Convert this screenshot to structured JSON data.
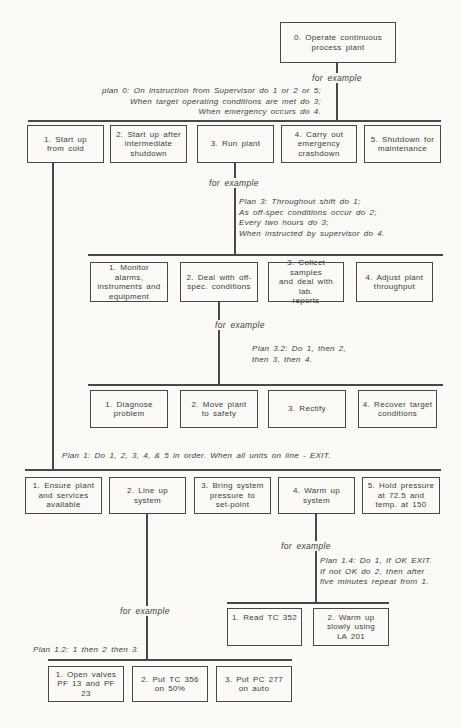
{
  "meta": {
    "background_color": "#fbfaf7",
    "ink_color": "#3c3c3c",
    "line_color": "#484848"
  },
  "labels": {
    "for_example": "for example"
  },
  "plans": {
    "plan0": "plan 0: On instruction from Supervisor  do 1 or 2 or 5;\nWhen target operating conditions are met do 3;\nWhen emergency occurs do 4.",
    "plan3": "Plan 3: Throughout shift do 1;\nAs off-spec conditions occur do 2;\nEvery two hours do 3;\nWhen instructed by supervisor do 4.",
    "plan3_2": "Plan 3.2: Do 1, then 2,\nthen 3, then 4.",
    "plan1": "Plan 1: Do 1, 2, 3, 4, & 5 in order. When all units on line -  EXIT.",
    "plan1_4": "Plan 1.4: Do 1, If OK EXIT.\nIf not OK do 2, then after\nfive minutes repeat from 1.",
    "plan1_2": "Plan 1.2: 1 then 2 then 3."
  },
  "boxes": {
    "root": "0. Operate continuous\nprocess plant",
    "level1": [
      "1. Start up\nfrom cold",
      "2. Start up after\nintermediate\nshutdown",
      "3. Run plant",
      "4. Carry out\nemergency\ncrashdown",
      "5. Shutdown for\nmaintenance"
    ],
    "run_plant_sub": [
      "1. Monitor alarms,\ninstruments and\nequipment",
      "2. Deal with off-\nspec. conditions",
      "3. Collect samples\nand deal with lab.\nreports",
      "4. Adjust plant\nthroughput"
    ],
    "offspec_sub": [
      "1. Diagnose\nproblem",
      "2. Move plant\nto safety",
      "3. Rectify",
      "4. Recover target\nconditions"
    ],
    "startup_sub": [
      "1. Ensure plant\nand services\navailable",
      "2. Line up\nsystem",
      "3. Bring system\npressure to\nset-point",
      "4. Warm up\nsystem",
      "5. Hold pressure\nat 72.5 and\ntemp. at 150"
    ],
    "warmup_sub": [
      "1. Read TC 352",
      "2. Warm up\nslowly using\nLA 201"
    ],
    "lineup_sub": [
      "1. Open valves\nPF 13 and PF 23",
      "2. Put TC 356\non 50%",
      "3. Put PC 277\non auto"
    ]
  }
}
